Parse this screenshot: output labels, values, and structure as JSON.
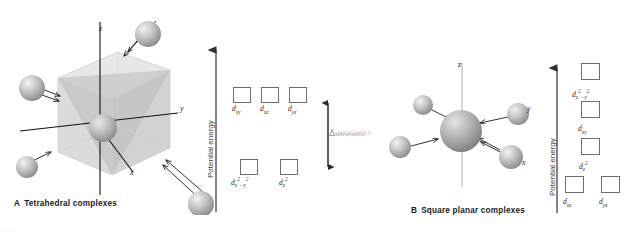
{
  "figure": {
    "background": "#ffffff",
    "box_stroke": "#6e6e6e",
    "delta_color": "#9a9a9a",
    "text_color": "#1a1a1a"
  },
  "panel_a": {
    "caption_letter": "A",
    "caption_text": "Tetrahedral complexes",
    "model": {
      "axis_x": "x",
      "axis_y": "y",
      "axis_z": "z",
      "ligand_count": 4,
      "central_atom": "metal-center",
      "shape": "cube-with-tetrahedral-ligands"
    },
    "energy_axis_label": "Potential energy",
    "splitting_label": "Δ",
    "splitting_subscript": "tetrahedral",
    "levels": [
      {
        "name": "upper",
        "orbitals": [
          {
            "base": "d",
            "sub": "xy",
            "sup": ""
          },
          {
            "base": "d",
            "sub": "xz",
            "sup": ""
          },
          {
            "base": "d",
            "sub": "yz",
            "sup": ""
          }
        ]
      },
      {
        "name": "lower",
        "orbitals": [
          {
            "base": "d",
            "sub": "x",
            "sup": "2",
            "sub2": "−y",
            "sup2": "2"
          },
          {
            "base": "d",
            "sub": "z",
            "sup": "2"
          }
        ]
      }
    ]
  },
  "panel_b": {
    "caption_letter": "B",
    "caption_text": "Square planar complexes",
    "model": {
      "axis_x": "x",
      "axis_y": "y",
      "axis_z": "z",
      "ligand_count": 4,
      "central_atom": "metal-center",
      "shape": "square-planar-ligands"
    },
    "energy_axis_label": "Potential energy",
    "levels": [
      {
        "name": "level-1",
        "orbitals": [
          {
            "base": "d",
            "sub": "x",
            "sup": "2",
            "sub2": "−y",
            "sup2": "2"
          }
        ]
      },
      {
        "name": "level-2",
        "orbitals": [
          {
            "base": "d",
            "sub": "xy",
            "sup": ""
          }
        ]
      },
      {
        "name": "level-3",
        "orbitals": [
          {
            "base": "d",
            "sub": "z",
            "sup": "2"
          }
        ]
      },
      {
        "name": "level-4",
        "orbitals": [
          {
            "base": "d",
            "sub": "xz",
            "sup": ""
          },
          {
            "base": "d",
            "sub": "yz",
            "sup": ""
          }
        ]
      }
    ]
  },
  "bleed_text": {
    "tetrahedral_bleed": "tetrahedral"
  }
}
